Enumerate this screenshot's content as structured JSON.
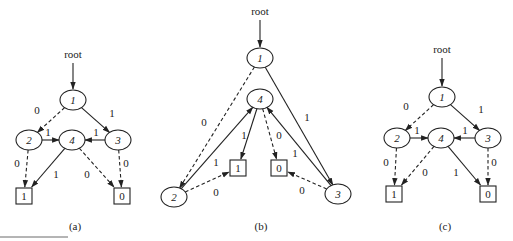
{
  "figure": {
    "panels": [
      {
        "id": "a",
        "caption": "(a)",
        "root_label": "root",
        "root": {
          "x": 73,
          "y": 60
        },
        "nodes": [
          {
            "id": "1",
            "label": "1",
            "x": 73,
            "y": 100
          },
          {
            "id": "2",
            "label": "2",
            "x": 29,
            "y": 140
          },
          {
            "id": "4",
            "label": "4",
            "x": 72,
            "y": 140
          },
          {
            "id": "3",
            "label": "3",
            "x": 118,
            "y": 140
          }
        ],
        "terminals": [
          {
            "id": "T1",
            "label": "1",
            "x": 24,
            "y": 196
          },
          {
            "id": "T0",
            "label": "0",
            "x": 122,
            "y": 196
          }
        ],
        "edges": [
          {
            "from": "1",
            "to": "2",
            "label": "0",
            "style": "dashed",
            "lx": 37,
            "ly": 114
          },
          {
            "from": "1",
            "to": "3",
            "label": "1",
            "style": "solid",
            "lx": 112,
            "ly": 117
          },
          {
            "from": "2",
            "to": "4",
            "label": "1",
            "style": "solid",
            "lx": 48,
            "ly": 136
          },
          {
            "from": "3",
            "to": "4",
            "label": "1",
            "style": "solid",
            "lx": 96,
            "ly": 136
          },
          {
            "from": "2",
            "to": "T1",
            "label": "0",
            "style": "dashed",
            "lx": 17,
            "ly": 167
          },
          {
            "from": "4",
            "to": "T1",
            "label": "1",
            "style": "solid",
            "lx": 56,
            "ly": 178
          },
          {
            "from": "4",
            "to": "T0",
            "label": "0",
            "style": "dashed",
            "lx": 87,
            "ly": 178
          },
          {
            "from": "3",
            "to": "T0",
            "label": "0",
            "style": "dashed",
            "lx": 126,
            "ly": 167
          }
        ]
      },
      {
        "id": "b",
        "caption": "(b)",
        "root_label": "root",
        "root": {
          "x": 260,
          "y": 17
        },
        "nodes": [
          {
            "id": "1",
            "label": "1",
            "x": 260,
            "y": 58
          },
          {
            "id": "4",
            "label": "4",
            "x": 260,
            "y": 99
          },
          {
            "id": "2",
            "label": "2",
            "x": 174,
            "y": 197
          },
          {
            "id": "3",
            "label": "3",
            "x": 338,
            "y": 194
          }
        ],
        "terminals": [
          {
            "id": "T1",
            "label": "1",
            "x": 238,
            "y": 168
          },
          {
            "id": "T0",
            "label": "0",
            "x": 279,
            "y": 168
          }
        ],
        "edges": [
          {
            "from": "1",
            "to": "2",
            "label": "0",
            "style": "dashed",
            "lx": 204,
            "ly": 126
          },
          {
            "from": "1",
            "to": "3",
            "label": "1",
            "style": "solid",
            "lx": 307,
            "ly": 121
          },
          {
            "from": "2",
            "to": "4",
            "label": "1",
            "style": "solid",
            "lx": 216,
            "ly": 166
          },
          {
            "from": "4",
            "to": "T1",
            "label": "1",
            "style": "solid",
            "lx": 244,
            "ly": 139
          },
          {
            "from": "4",
            "to": "T0",
            "label": "0",
            "style": "dashed",
            "lx": 279,
            "ly": 139
          },
          {
            "from": "3",
            "to": "4",
            "label": "1",
            "style": "solid",
            "lx": 295,
            "ly": 157
          },
          {
            "from": "2",
            "to": "T1",
            "label": "0",
            "style": "dashed",
            "lx": 216,
            "ly": 196
          },
          {
            "from": "3",
            "to": "T0",
            "label": "0",
            "style": "dashed",
            "lx": 302,
            "ly": 194
          }
        ]
      },
      {
        "id": "c",
        "caption": "(c)",
        "root_label": "root",
        "root": {
          "x": 442,
          "y": 55
        },
        "nodes": [
          {
            "id": "1",
            "label": "1",
            "x": 442,
            "y": 97
          },
          {
            "id": "2",
            "label": "2",
            "x": 397,
            "y": 138
          },
          {
            "id": "4",
            "label": "4",
            "x": 441,
            "y": 138
          },
          {
            "id": "3",
            "label": "3",
            "x": 488,
            "y": 138
          }
        ],
        "terminals": [
          {
            "id": "T1",
            "label": "1",
            "x": 394,
            "y": 194
          },
          {
            "id": "T0",
            "label": "0",
            "x": 488,
            "y": 194
          }
        ],
        "edges": [
          {
            "from": "1",
            "to": "2",
            "label": "0",
            "style": "dashed",
            "lx": 406,
            "ly": 110
          },
          {
            "from": "1",
            "to": "3",
            "label": "1",
            "style": "solid",
            "lx": 481,
            "ly": 113
          },
          {
            "from": "2",
            "to": "4",
            "label": "1",
            "style": "solid",
            "lx": 417,
            "ly": 134
          },
          {
            "from": "3",
            "to": "4",
            "label": "1",
            "style": "solid",
            "lx": 465,
            "ly": 134
          },
          {
            "from": "2",
            "to": "T1",
            "label": "0",
            "style": "dashed",
            "lx": 386,
            "ly": 166
          },
          {
            "from": "4",
            "to": "T1",
            "label": "0",
            "style": "dashed",
            "lx": 425,
            "ly": 176
          },
          {
            "from": "4",
            "to": "T0",
            "label": "1",
            "style": "solid",
            "lx": 456,
            "ly": 176
          },
          {
            "from": "3",
            "to": "T0",
            "label": "0",
            "style": "dashed",
            "lx": 494,
            "ly": 166
          }
        ]
      }
    ],
    "captions": {
      "a": "(a)",
      "b": "(b)",
      "c": "(c)"
    }
  },
  "colors": {
    "stroke": "#222222",
    "background": "#ffffff"
  }
}
